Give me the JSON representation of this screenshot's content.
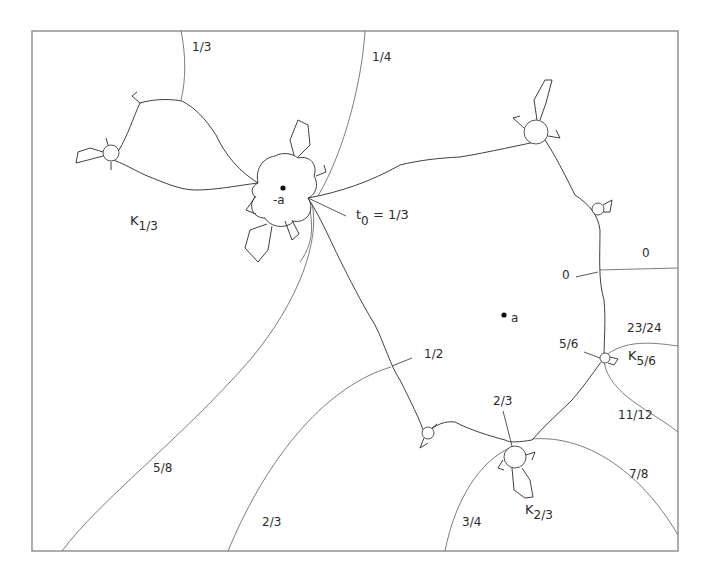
{
  "figure": {
    "kind": "Julia set with external rays",
    "points": [
      {
        "id": "minus-a",
        "label": "-a"
      },
      {
        "id": "a",
        "label": "a"
      }
    ],
    "ray_labels": {
      "r_1_3": "1/3",
      "r_1_4": "1/4",
      "r_0_top": "0",
      "r_0_inner": "0",
      "r_23_24": "23/24",
      "r_5_6": "5/6",
      "r_11_12": "11/12",
      "r_2_3_inner": "2/3",
      "r_7_8": "7/8",
      "r_3_4": "3/4",
      "r_2_3_bottom": "2/3",
      "r_5_8": "5/8",
      "r_1_2": "1/2"
    },
    "t0_label": {
      "symbol": "t",
      "subscript": "0",
      "rest": " = 1/3"
    },
    "components": {
      "k_1_3": {
        "symbol": "K",
        "subscript": "1/3"
      },
      "k_5_6": {
        "symbol": "K",
        "subscript": "5/6"
      },
      "k_2_3": {
        "symbol": "K",
        "subscript": "2/3"
      }
    },
    "colors": {
      "line": "#2a2a2a",
      "ray": "#6e6e6e",
      "frame": "#8a8a8a",
      "background": "#ffffff"
    }
  }
}
